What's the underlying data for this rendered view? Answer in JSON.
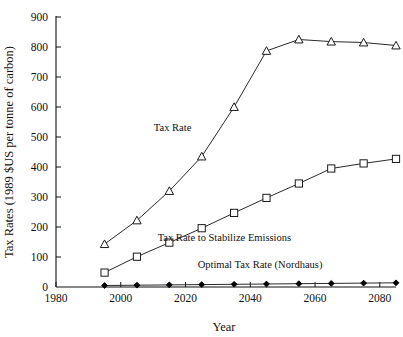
{
  "chart_data": {
    "type": "line",
    "title": "",
    "xlabel": "Year",
    "ylabel": "Tax Rates (1989 $US per tonne of carbon)",
    "xlim": [
      1980,
      2085
    ],
    "ylim": [
      0,
      900
    ],
    "xticks": [
      1980,
      2000,
      2020,
      2040,
      2060,
      2080
    ],
    "xtick_labels": [
      "1980",
      "2000",
      "2020",
      "2040",
      "2060",
      "2080"
    ],
    "yticks": [
      0,
      100,
      200,
      300,
      400,
      500,
      600,
      700,
      800,
      900
    ],
    "ytick_labels": [
      "0",
      "100",
      "200",
      "300",
      "400",
      "500",
      "600",
      "700",
      "800",
      "900"
    ],
    "grid": false,
    "legend_position": "inline-annotations",
    "x": [
      1995,
      2005,
      2015,
      2025,
      2035,
      2045,
      2055,
      2065,
      2075,
      2085
    ],
    "series": [
      {
        "name": "Tax Rate",
        "marker": "open-triangle",
        "label": "Tax Rate",
        "label_x": 2016,
        "label_y": 520,
        "values": [
          143,
          222,
          320,
          435,
          600,
          787,
          825,
          818,
          815,
          805
        ]
      },
      {
        "name": "Tax Rate to Stabilize Emissions",
        "marker": "open-square",
        "label": "Tax Rate to Stabilize Emissions",
        "label_x": 2032,
        "label_y": 155,
        "values": [
          48,
          101,
          148,
          196,
          247,
          297,
          345,
          395,
          412,
          427
        ]
      },
      {
        "name": "Optimal Tax Rate (Nordhaus)",
        "marker": "filled-diamond",
        "label": "Optimal Tax Rate (Nordhaus)",
        "label_x": 2043,
        "label_y": 62,
        "values": [
          5,
          6,
          7,
          8,
          9,
          10,
          11,
          12,
          13,
          14
        ]
      }
    ]
  },
  "axes": {
    "x_axis_name": "year-axis",
    "y_axis_name": "tax-rate-axis"
  }
}
